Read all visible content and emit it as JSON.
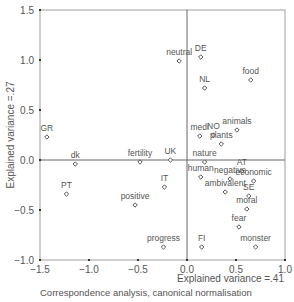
{
  "chart_data": {
    "type": "scatter",
    "title": "",
    "caption": "Correspondence analysis, canonical normalisation",
    "xlabel": "Explained variance =.41",
    "ylabel": "Explained variance =.27",
    "xlim": [
      -1.5,
      1.0
    ],
    "ylim": [
      -1.0,
      1.5
    ],
    "xticks": [
      "-1.5",
      "-1.0",
      "-0.5",
      "0.0",
      "0.5",
      "1.0"
    ],
    "yticks": [
      "-1.0",
      "-0.5",
      "0.0",
      "0.5",
      "1.0",
      "1.5"
    ],
    "grid": false,
    "reference_lines": {
      "x": 0,
      "y": 0
    },
    "points": [
      {
        "label": "GR",
        "x": -1.43,
        "y": 0.23
      },
      {
        "label": "dk",
        "x": -1.14,
        "y": -0.04
      },
      {
        "label": "PT",
        "x": -1.23,
        "y": -0.34
      },
      {
        "label": "fertility",
        "x": -0.48,
        "y": -0.02
      },
      {
        "label": "UK",
        "x": -0.17,
        "y": 0.0
      },
      {
        "label": "IT",
        "x": -0.23,
        "y": -0.27
      },
      {
        "label": "positive",
        "x": -0.53,
        "y": -0.45
      },
      {
        "label": "progress",
        "x": -0.24,
        "y": -0.87
      },
      {
        "label": "neutral",
        "x": -0.08,
        "y": 0.99
      },
      {
        "label": "DE",
        "x": 0.14,
        "y": 1.03
      },
      {
        "label": "NL",
        "x": 0.18,
        "y": 0.72
      },
      {
        "label": "food",
        "x": 0.65,
        "y": 0.8
      },
      {
        "label": "medi",
        "x": 0.13,
        "y": 0.24
      },
      {
        "label": "NO",
        "x": 0.27,
        "y": 0.25
      },
      {
        "label": "animals",
        "x": 0.51,
        "y": 0.3
      },
      {
        "label": "plants",
        "x": 0.35,
        "y": 0.16
      },
      {
        "label": "nature",
        "x": 0.18,
        "y": -0.02
      },
      {
        "label": "human",
        "x": 0.14,
        "y": -0.17
      },
      {
        "label": "negative",
        "x": 0.44,
        "y": -0.19
      },
      {
        "label": "AT",
        "x": 0.56,
        "y": -0.11
      },
      {
        "label": "economic",
        "x": 0.68,
        "y": -0.21
      },
      {
        "label": "ambivalent",
        "x": 0.39,
        "y": -0.32
      },
      {
        "label": "SE",
        "x": 0.63,
        "y": -0.36
      },
      {
        "label": "moral",
        "x": 0.61,
        "y": -0.49
      },
      {
        "label": "fear",
        "x": 0.53,
        "y": -0.67
      },
      {
        "label": "FI",
        "x": 0.15,
        "y": -0.87
      },
      {
        "label": "monster",
        "x": 0.7,
        "y": -0.87
      }
    ]
  },
  "colors": {
    "axis": "#666666",
    "marker": "#555555",
    "text": "#555555"
  }
}
